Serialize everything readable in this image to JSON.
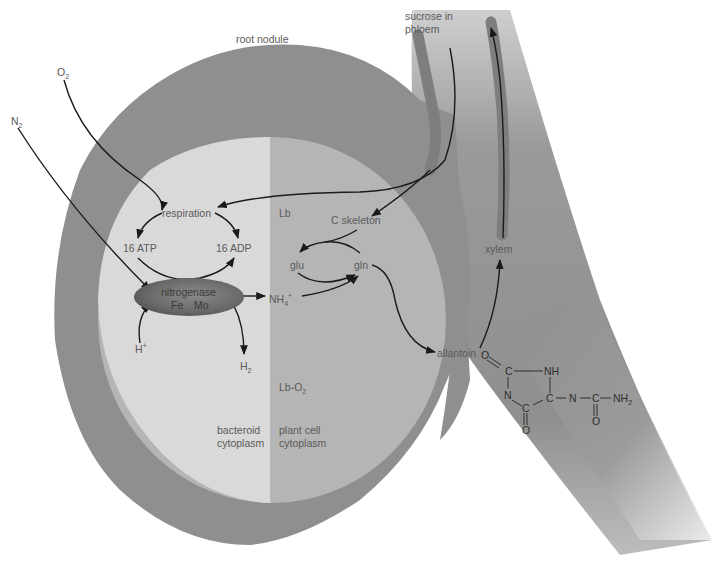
{
  "diagram": {
    "colors": {
      "background": "#ffffff",
      "root_tissue": "#8f8f8f",
      "bacteroid_cytoplasm": "#d9d9d9",
      "plant_cell_cytoplasm": "#b5b5b5",
      "vascular_strand": "#7d7d7d",
      "nitrogenase_enzyme": "#6e6e6e",
      "arrow": "#1a1a1a",
      "label_text": "#5a5a5a"
    },
    "labels": {
      "root_nodule": "root nodule",
      "sucrose_line1": "sucrose in",
      "sucrose_line2": "phloem",
      "o2": "O",
      "o2_sub": "2",
      "n2": "N",
      "n2_sub": "2",
      "respiration": "respiration",
      "atp": "16 ATP",
      "adp": "16 ADP",
      "lb": "Lb",
      "c_skeleton": "C skeleton",
      "glu": "glu",
      "gln": "gln",
      "nitrogenase": "nitrogenase",
      "fe": "Fe",
      "mo": "Mo",
      "nh4": "NH",
      "nh4_sub": "4",
      "nh4_sup": "+",
      "h_plus": "H",
      "h_plus_sup": "+",
      "h2": "H",
      "h2_sub": "2",
      "lb_o2": "Lb-O",
      "lb_o2_sub": "2",
      "bacteroid_line1": "bacteroid",
      "bacteroid_line2": "cytoplasm",
      "plant_line1": "plant cell",
      "plant_line2": "cytoplasm",
      "xylem": "xylem",
      "allantoin": "allantoin"
    },
    "allantoin_structure": {
      "o_top": "O",
      "c1": "C",
      "nh": "NH",
      "n_ring": "N",
      "c_ring": "C",
      "c2": "C",
      "o_bottom": "O",
      "n_chain": "N",
      "c_chain": "C",
      "nh2": "NH",
      "nh2_sub": "2",
      "o_chain": "O"
    },
    "regions": [
      {
        "name": "root nodule",
        "type": "outer tissue"
      },
      {
        "name": "bacteroid cytoplasm",
        "type": "inner left half"
      },
      {
        "name": "plant cell cytoplasm",
        "type": "inner right half"
      },
      {
        "name": "phloem",
        "type": "vascular strand"
      },
      {
        "name": "xylem",
        "type": "vascular strand"
      }
    ],
    "flows": [
      {
        "from": "O2",
        "to": "respiration"
      },
      {
        "from": "sucrose in phloem",
        "to": "respiration"
      },
      {
        "from": "sucrose in phloem",
        "to": "C skeleton"
      },
      {
        "from": "respiration",
        "to": "16 ATP"
      },
      {
        "from": "respiration",
        "to": "16 ADP"
      },
      {
        "from": "16 ATP",
        "to": "16 ADP"
      },
      {
        "from": "N2",
        "to": "nitrogenase"
      },
      {
        "from": "H+",
        "to": "nitrogenase"
      },
      {
        "from": "nitrogenase",
        "to": "NH4+"
      },
      {
        "from": "nitrogenase",
        "to": "H2"
      },
      {
        "from": "NH4+",
        "to": "gln"
      },
      {
        "from": "glu",
        "to": "gln"
      },
      {
        "from": "C skeleton",
        "to": "glu"
      },
      {
        "from": "gln",
        "to": "glu"
      },
      {
        "from": "gln",
        "to": "allantoin"
      },
      {
        "from": "allantoin",
        "to": "xylem"
      }
    ]
  }
}
